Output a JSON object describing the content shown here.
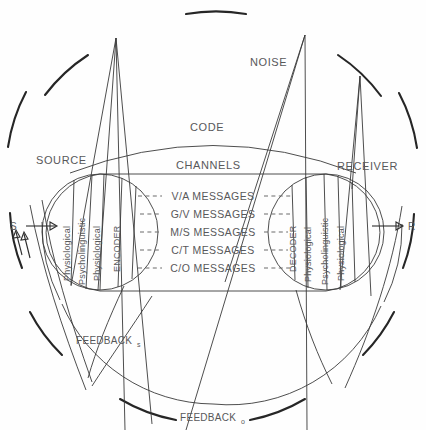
{
  "diagram": {
    "type": "schematic",
    "text_color": "#58585a",
    "line_color": "#3a3a3a"
  },
  "labels": {
    "source": "SOURCE",
    "receiver": "RECEIVER",
    "code": "CODE",
    "channels": "CHANNELS",
    "noise": "NOISE",
    "feedback_s": "FEEDBACK",
    "feedback_s_sub": "s",
    "feedback_o": "FEEDBACK",
    "feedback_o_sub": "o",
    "input_terminal": "S",
    "output_terminal": "R"
  },
  "encoder_bands": [
    {
      "label": "Physiological"
    },
    {
      "label": "Psycholinguistic"
    },
    {
      "label": "Physiological"
    },
    {
      "label": "ENCODER"
    }
  ],
  "decoder_bands": [
    {
      "label": "DECODER"
    },
    {
      "label": "Physiological"
    },
    {
      "label": "Psycholinguistic"
    },
    {
      "label": "Physiological"
    }
  ],
  "messages": [
    {
      "code": "V/A",
      "label": "V/A  MESSAGES"
    },
    {
      "code": "G/V",
      "label": "G/V  MESSAGES"
    },
    {
      "code": "M/S",
      "label": "M/S  MESSAGES"
    },
    {
      "code": "C/T",
      "label": "C/T  MESSAGES"
    },
    {
      "code": "C/O",
      "label": "C/O  MESSAGES"
    }
  ]
}
